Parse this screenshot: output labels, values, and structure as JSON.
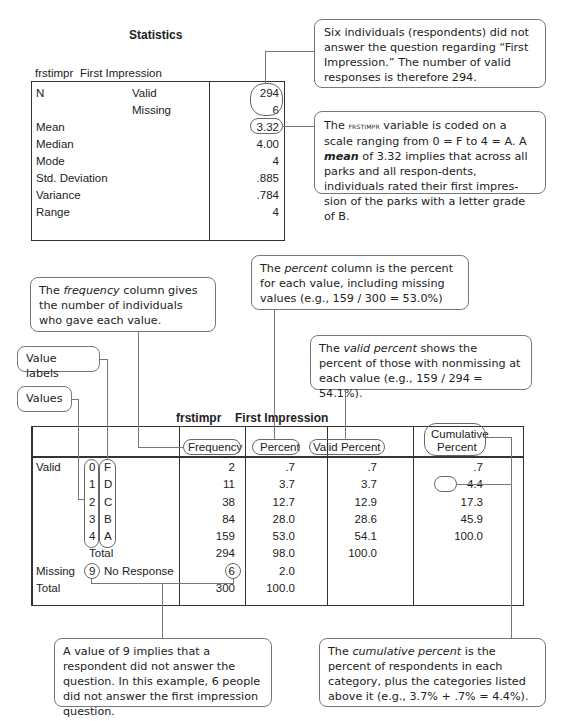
{
  "stats": {
    "title": "Statistics",
    "var_name": "frstimpr",
    "var_label": "First Impression",
    "rows": [
      {
        "label": "N",
        "sub": "Valid",
        "value": "294"
      },
      {
        "label": "",
        "sub": "Missing",
        "value": "6"
      },
      {
        "label": "Mean",
        "sub": "",
        "value": "3.32"
      },
      {
        "label": "Median",
        "sub": "",
        "value": "4.00"
      },
      {
        "label": "Mode",
        "sub": "",
        "value": "4"
      },
      {
        "label": "Std. Deviation",
        "sub": "",
        "value": ".885"
      },
      {
        "label": "Variance",
        "sub": "",
        "value": ".784"
      },
      {
        "label": "Range",
        "sub": "",
        "value": "4"
      }
    ]
  },
  "freq": {
    "var_name": "frstimpr",
    "var_label": "First Impression",
    "headers": {
      "frequency": "Frequency",
      "percent": "Percent",
      "valid_percent": "Valid Percent",
      "cumulative_percent_1": "Cumulative",
      "cumulative_percent_2": "Percent"
    },
    "rows": [
      {
        "group": "Valid",
        "value": "0",
        "label": "F",
        "frequency": "2",
        "percent": ".7",
        "valid_percent": ".7",
        "cumulative": ".7"
      },
      {
        "group": "",
        "value": "1",
        "label": "D",
        "frequency": "11",
        "percent": "3.7",
        "valid_percent": "3.7",
        "cumulative": "4.4"
      },
      {
        "group": "",
        "value": "2",
        "label": "C",
        "frequency": "38",
        "percent": "12.7",
        "valid_percent": "12.9",
        "cumulative": "17.3"
      },
      {
        "group": "",
        "value": "3",
        "label": "B",
        "frequency": "84",
        "percent": "28.0",
        "valid_percent": "28.6",
        "cumulative": "45.9"
      },
      {
        "group": "",
        "value": "4",
        "label": "A",
        "frequency": "159",
        "percent": "53.0",
        "valid_percent": "54.1",
        "cumulative": "100.0"
      },
      {
        "group": "",
        "value": "",
        "label": "Total",
        "frequency": "294",
        "percent": "98.0",
        "valid_percent": "100.0",
        "cumulative": ""
      },
      {
        "group": "Missing",
        "value": "9",
        "label": "No Response",
        "frequency": "6",
        "percent": "2.0",
        "valid_percent": "",
        "cumulative": ""
      },
      {
        "group": "Total",
        "value": "",
        "label": "",
        "frequency": "300",
        "percent": "100.0",
        "valid_percent": "",
        "cumulative": ""
      }
    ]
  },
  "callouts": {
    "missing_note": "Six individuals (respondents) did not answer the question regarding “First Impression.” The number of valid responses is therefore 294.",
    "mean_note_pre": "The ",
    "mean_note_var": "frstimpr",
    "mean_note_mid": " variable is coded on a scale ranging from 0 = F to 4 = A. A ",
    "mean_note_em": "mean",
    "mean_note_post": " of 3.32 implies that across all parks and all respon-dents, individuals rated their first impres-sion of the parks with a letter grade of B.",
    "frequency_pre": "The ",
    "frequency_em": "frequency",
    "frequency_post": " column gives the number of individuals who gave each value.",
    "percent_pre": "The ",
    "percent_em": "percent",
    "percent_post": " column is the percent for each value, including missing values (e.g., 159 / 300 = 53.0%)",
    "valid_pre": "The ",
    "valid_em": "valid percent",
    "valid_post": " shows the percent of those with nonmissing at each value (e.g., 159 / 294 = 54.1%).",
    "value_labels": "Value labels",
    "values": "Values",
    "missing_value_note": "A value of 9 implies that a respondent did not answer the question. In this example, 6 people did not answer the first impression question.",
    "cumulative_pre": "The ",
    "cumulative_em": "cumulative percent",
    "cumulative_post": " is the percent of respondents in each category, plus the categories listed above it (e.g., 3.7% + .7% = 4.4%)."
  }
}
